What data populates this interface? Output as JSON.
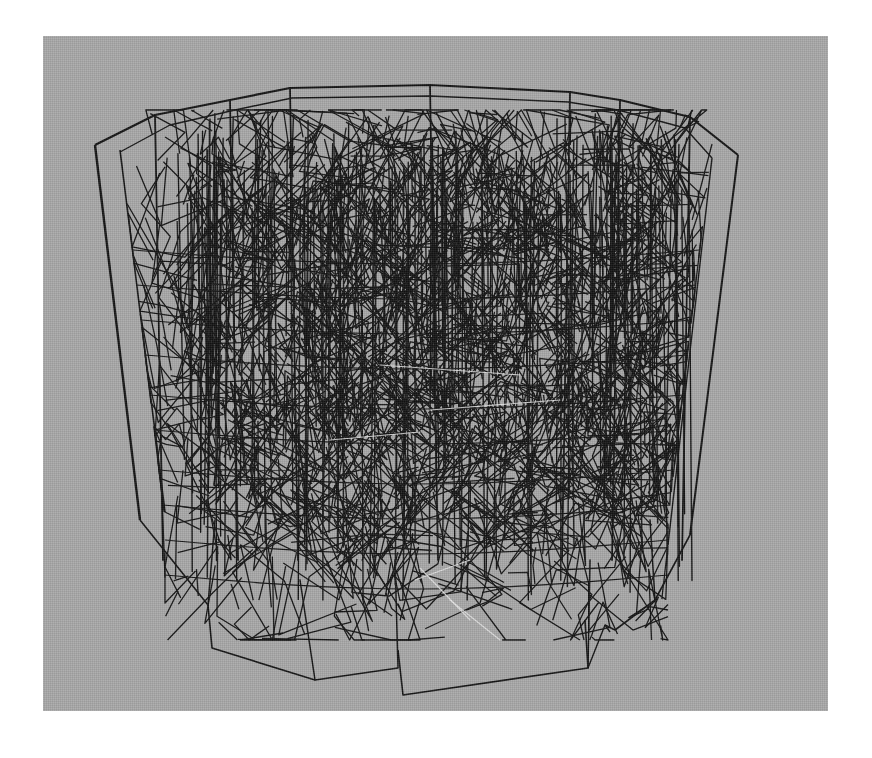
{
  "figure": {
    "canvas": {
      "width": 872,
      "height": 758,
      "background": "#ffffff"
    },
    "panel": {
      "x": 43,
      "y": 36,
      "width": 785,
      "height": 675,
      "color": "#a9a9a9"
    },
    "render_style": "wireframe",
    "line_color": "#141414",
    "highlight_line_color": "#e6e6e6",
    "outline": {
      "top_rim": [
        [
          95,
          145
        ],
        [
          155,
          115
        ],
        [
          230,
          100
        ],
        [
          290,
          88
        ],
        [
          430,
          85
        ],
        [
          570,
          92
        ],
        [
          620,
          100
        ],
        [
          690,
          117
        ],
        [
          738,
          155
        ]
      ],
      "inner_top_rim": [
        [
          120,
          152
        ],
        [
          170,
          125
        ],
        [
          235,
          110
        ],
        [
          292,
          98
        ],
        [
          430,
          96
        ],
        [
          568,
          102
        ],
        [
          618,
          110
        ],
        [
          685,
          128
        ],
        [
          712,
          158
        ]
      ],
      "left_edge_outer": [
        [
          95,
          145
        ],
        [
          140,
          520
        ]
      ],
      "left_edge_inner": [
        [
          120,
          150
        ],
        [
          165,
          512
        ]
      ],
      "right_edge_outer": [
        [
          738,
          155
        ],
        [
          690,
          535
        ]
      ],
      "right_edge_inner": [
        [
          712,
          158
        ],
        [
          668,
          545
        ]
      ],
      "bottom_left": [
        [
          140,
          520
        ],
        [
          208,
          605
        ],
        [
          212,
          648
        ],
        [
          315,
          680
        ],
        [
          398,
          668
        ]
      ],
      "bottom_center": [
        [
          398,
          650
        ],
        [
          403,
          695
        ],
        [
          588,
          668
        ],
        [
          585,
          620
        ]
      ],
      "bottom_right": [
        [
          605,
          625
        ],
        [
          615,
          630
        ],
        [
          655,
          600
        ],
        [
          690,
          535
        ]
      ],
      "bottom_right_lower": [
        [
          610,
          632
        ],
        [
          605,
          625
        ],
        [
          588,
          668
        ]
      ],
      "vertical_posts_x": [
        155,
        230,
        290,
        430,
        570,
        620,
        690
      ],
      "bottom_posts": [
        [
          [
            208,
            605
          ],
          [
            215,
            520
          ]
        ],
        [
          [
            315,
            680
          ],
          [
            300,
            580
          ]
        ],
        [
          [
            398,
            668
          ],
          [
            395,
            560
          ]
        ],
        [
          [
            588,
            668
          ],
          [
            590,
            560
          ]
        ],
        [
          [
            655,
            600
          ],
          [
            650,
            520
          ]
        ]
      ]
    },
    "mesh": {
      "seed": 1337,
      "segment_count": 1400,
      "region": {
        "x_min": 150,
        "x_max": 700,
        "y_min": 110,
        "y_max": 640
      },
      "density_core": {
        "x_min": 200,
        "x_max": 680,
        "y_min": 130,
        "y_max": 520
      },
      "vertical_bias": 0.45,
      "max_len": 70,
      "stroke_width": 1.3
    },
    "horizontal_rings_y": [
      250,
      285,
      320,
      355,
      395,
      430,
      470,
      505,
      540,
      575
    ],
    "highlight_segments": [
      [
        [
          330,
          440
        ],
        [
          420,
          432
        ]
      ],
      [
        [
          420,
          568
        ],
        [
          470,
          620
        ]
      ],
      [
        [
          450,
          600
        ],
        [
          500,
          640
        ]
      ],
      [
        [
          415,
          580
        ],
        [
          470,
          560
        ]
      ],
      [
        [
          380,
          365
        ],
        [
          520,
          375
        ]
      ],
      [
        [
          430,
          410
        ],
        [
          560,
          400
        ]
      ]
    ]
  }
}
